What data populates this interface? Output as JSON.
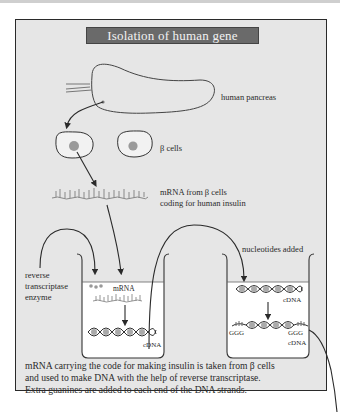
{
  "title": "Isolation of human gene",
  "labels": {
    "pancreas": "human pancreas",
    "beta_cells": "β cells",
    "mrna_line1": "mRNA from β cells",
    "mrna_line2": "coding for human insulin",
    "enzyme_line1": "reverse",
    "enzyme_line2": "transcriptase",
    "enzyme_line3": "enzyme",
    "tube1_mrna": "mRNA",
    "tube1_cdna": "cDNA",
    "nucleotides": "nucleotides added",
    "tube2_cdna_top": "cDNA",
    "tube2_ggg_left": "GGG",
    "tube2_ggg_right": "GGG",
    "tube2_cdna_bottom": "cDNA"
  },
  "caption": {
    "line1": "mRNA carrying the code for making insulin is taken from β cells",
    "line2": "and used to make DNA with the help of reverse transcriptase.",
    "line3": "Extra guanines are added to each end of the DNA strands."
  },
  "colors": {
    "panel_bg": "#e6e6e6",
    "title_bg": "#6a6a6a",
    "title_text": "#f2f2f2",
    "line": "#2a2a2a",
    "tube_fill": "#ffffff",
    "nucleus": "#9a9a9a"
  }
}
